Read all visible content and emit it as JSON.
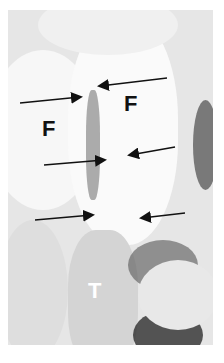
{
  "image": {
    "description": "Grayscale anatomical photograph with black arrows and letter labels",
    "width": 224,
    "height": 363
  },
  "labels": [
    {
      "text": "F",
      "x": 42,
      "y": 118,
      "size": 22,
      "color": "#111111"
    },
    {
      "text": "F",
      "x": 124,
      "y": 93,
      "size": 22,
      "color": "#111111"
    },
    {
      "text": "T",
      "x": 88,
      "y": 280,
      "size": 22,
      "color": "#ffffff"
    }
  ],
  "arrows": [
    {
      "x1": 167,
      "y1": 78,
      "x2": 100,
      "y2": 86
    },
    {
      "x1": 20,
      "y1": 103,
      "x2": 80,
      "y2": 97
    },
    {
      "x1": 44,
      "y1": 165,
      "x2": 104,
      "y2": 160
    },
    {
      "x1": 175,
      "y1": 147,
      "x2": 130,
      "y2": 155
    },
    {
      "x1": 35,
      "y1": 220,
      "x2": 92,
      "y2": 215
    },
    {
      "x1": 185,
      "y1": 213,
      "x2": 142,
      "y2": 218
    }
  ],
  "colors": {
    "arrow": "#111111",
    "background": "#ffffff"
  }
}
